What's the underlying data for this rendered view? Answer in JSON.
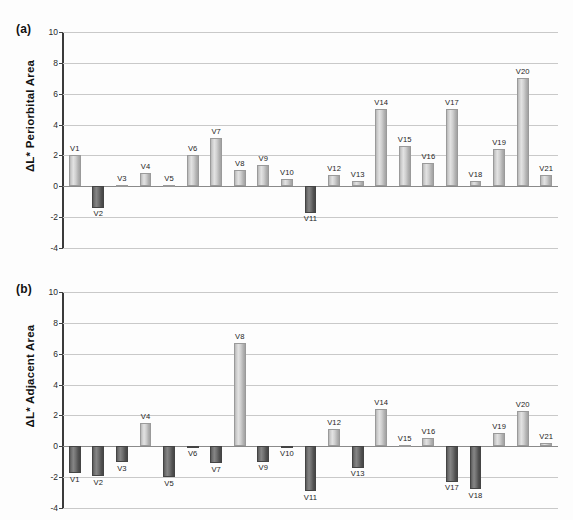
{
  "figure": {
    "width": 573,
    "height": 520,
    "background": "#ffffff"
  },
  "chart_data": [
    {
      "type": "bar",
      "panel": "a",
      "panel_label": "(a)",
      "title": "",
      "xlabel": "",
      "ylabel": "ΔL* Periorbital Area",
      "ylim": [
        -4,
        10
      ],
      "yticks": [
        -4,
        -2,
        0,
        2,
        4,
        6,
        8,
        10
      ],
      "ytick_labels": [
        "-4",
        "-2",
        "0",
        "2",
        "4",
        "6",
        "8",
        "10"
      ],
      "grid": true,
      "legend": "none",
      "categories": [
        "V1",
        "V2",
        "V3",
        "V4",
        "V5",
        "V6",
        "V7",
        "V8",
        "V9",
        "V10",
        "V11",
        "V12",
        "V13",
        "V14",
        "V15",
        "V16",
        "V17",
        "V18",
        "V19",
        "V20",
        "V21"
      ],
      "values": [
        2.0,
        -1.4,
        0.1,
        0.85,
        0.1,
        2.0,
        3.1,
        1.05,
        1.35,
        0.45,
        -1.7,
        0.7,
        0.35,
        5.0,
        2.6,
        1.5,
        5.0,
        0.35,
        2.4,
        7.0,
        0.75
      ],
      "colors": {
        "positive": "#d2d2d2",
        "negative": "#5f5f5f",
        "gridline": "#c9c9c9",
        "axis": "#3a3a3a"
      }
    },
    {
      "type": "bar",
      "panel": "b",
      "panel_label": "(b)",
      "title": "",
      "xlabel": "",
      "ylabel": "ΔL* Adjacent Area",
      "ylim": [
        -4,
        10
      ],
      "yticks": [
        -4,
        -2,
        0,
        2,
        4,
        6,
        8,
        10
      ],
      "ytick_labels": [
        "-4",
        "-2",
        "0",
        "2",
        "4",
        "6",
        "8",
        "10"
      ],
      "grid": true,
      "legend": "none",
      "categories": [
        "V1",
        "V2",
        "V3",
        "V4",
        "V5",
        "V6",
        "V7",
        "V8",
        "V9",
        "V10",
        "V11",
        "V12",
        "V13",
        "V14",
        "V15",
        "V16",
        "V17",
        "V18",
        "V19",
        "V20",
        "V21"
      ],
      "values": [
        -1.75,
        -1.95,
        -1.05,
        1.5,
        -2.0,
        -0.1,
        -1.1,
        6.7,
        -1.0,
        -0.1,
        -2.9,
        1.1,
        -1.4,
        2.4,
        0.1,
        0.55,
        -2.3,
        -2.8,
        0.85,
        2.3,
        0.2
      ],
      "colors": {
        "positive": "#d2d2d2",
        "negative": "#5f5f5f",
        "gridline": "#c9c9c9",
        "axis": "#3a3a3a"
      }
    }
  ]
}
